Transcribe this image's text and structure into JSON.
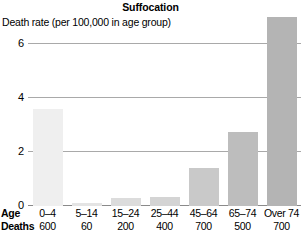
{
  "chart_data": {
    "type": "bar",
    "title": "Suffocation",
    "ylabel": "Death rate (per 100,000 in age group)",
    "xlabel": "Age",
    "categories": [
      "0–4",
      "5–14",
      "15–24",
      "25–44",
      "45–64",
      "65–74",
      "Over 74"
    ],
    "values": [
      3.6,
      0.1,
      0.3,
      0.35,
      1.4,
      2.75,
      7.0
    ],
    "ylim": [
      0,
      6.3
    ],
    "yticks": [
      0,
      2,
      4,
      6
    ],
    "ytick_labels": [
      "0",
      "2",
      "4",
      "6"
    ],
    "grid": true,
    "legend": "none",
    "secondary_row": {
      "label": "Deaths",
      "values": [
        "600",
        "60",
        "200",
        "400",
        "700",
        "500",
        "700"
      ]
    },
    "bar_colors": [
      "#efefef",
      "#e4e4e4",
      "#dcdcdc",
      "#d4d4d4",
      "#c9c9c9",
      "#bdbdbd",
      "#b4b4b4"
    ]
  },
  "axis": {
    "age_row_label": "Age",
    "deaths_row_label": "Deaths"
  }
}
